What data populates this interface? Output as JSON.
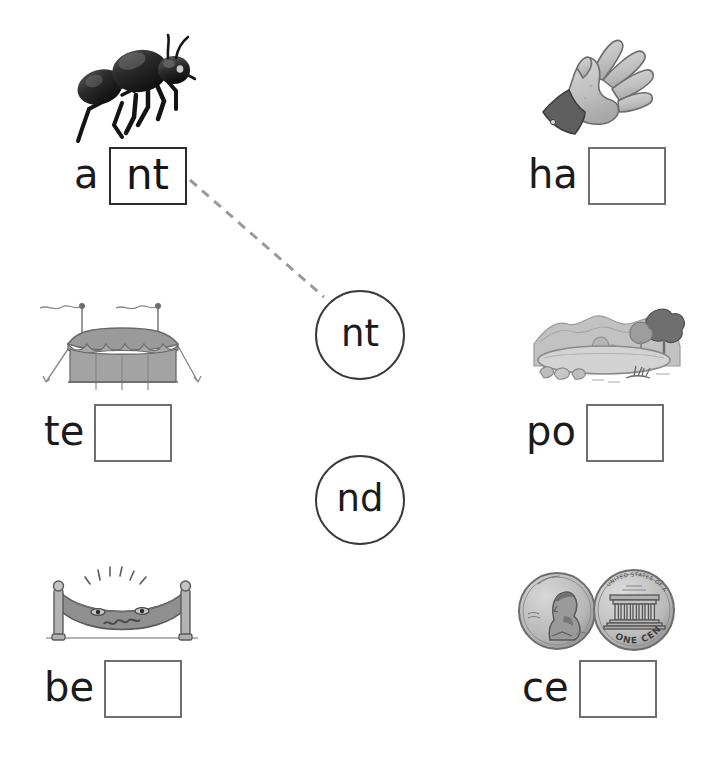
{
  "worksheet": {
    "type": "phonics-word-ending-matching",
    "background_color": "#ffffff",
    "ink_color": "#1b1b1b",
    "box_border_color": "#6e6e6e",
    "connector_color": "#9a9a9a"
  },
  "endings": [
    {
      "id": "nt",
      "label": "nt",
      "matched": true
    },
    {
      "id": "nd",
      "label": "nd",
      "matched": false
    }
  ],
  "items": [
    {
      "id": "ant",
      "picture": "ant-illustration",
      "prefix": "a",
      "answer": "nt",
      "filled": true,
      "connected_to": "nt"
    },
    {
      "id": "hand",
      "picture": "hand-illustration",
      "prefix": "ha",
      "answer": "",
      "filled": false,
      "connected_to": ""
    },
    {
      "id": "tent",
      "picture": "tent-illustration",
      "prefix": "te",
      "answer": "",
      "filled": false,
      "connected_to": ""
    },
    {
      "id": "pond",
      "picture": "pond-illustration",
      "prefix": "po",
      "answer": "",
      "filled": false,
      "connected_to": ""
    },
    {
      "id": "bed",
      "picture": "bed-illustration",
      "prefix": "be",
      "answer": "",
      "filled": false,
      "connected_to": ""
    },
    {
      "id": "cent",
      "picture": "pennies-illustration",
      "prefix": "ce",
      "answer": "",
      "filled": false,
      "connected_to": ""
    }
  ],
  "coin_text": {
    "reverse_motto": "UNITED STATES OF AMERICA",
    "reverse_denomination": "ONE CENT"
  }
}
